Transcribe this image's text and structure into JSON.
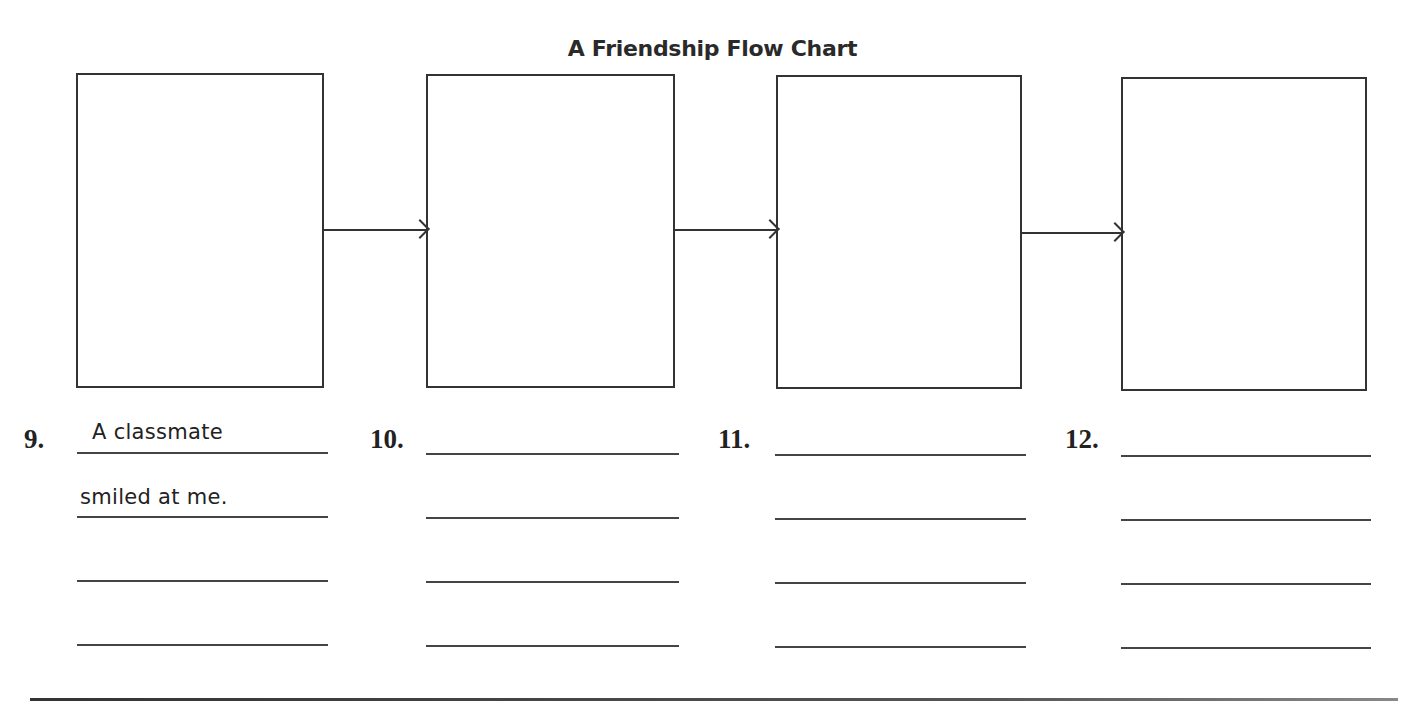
{
  "title": "A Friendship Flow Chart",
  "boxes": [
    {
      "index": 1,
      "content": ""
    },
    {
      "index": 2,
      "content": ""
    },
    {
      "index": 3,
      "content": ""
    },
    {
      "index": 4,
      "content": ""
    }
  ],
  "answers": [
    {
      "number": "9.",
      "lines": [
        "A classmate",
        "smiled at me.",
        "",
        ""
      ]
    },
    {
      "number": "10.",
      "lines": [
        "",
        "",
        "",
        ""
      ]
    },
    {
      "number": "11.",
      "lines": [
        "",
        "",
        "",
        ""
      ]
    },
    {
      "number": "12.",
      "lines": [
        "",
        "",
        "",
        ""
      ]
    }
  ],
  "colors": {
    "ink": "#333333",
    "background": "#ffffff"
  }
}
